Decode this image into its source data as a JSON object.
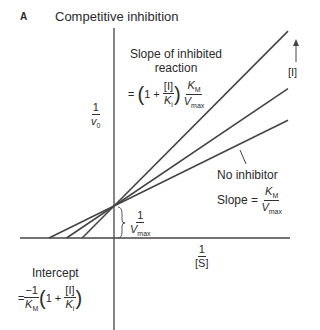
{
  "panel_letter": "A",
  "title": "Competitive inhibition",
  "y_axis_label": {
    "num": "1",
    "den": "v",
    "den_sub": "0"
  },
  "x_axis_label": {
    "num": "1",
    "den": "[S]"
  },
  "inhibitor_arrow_label": "[I]",
  "slope_inhibited": {
    "line1": "Slope of inhibited",
    "line2": "reaction",
    "eq_prefix": "=",
    "one_plus": "1 +",
    "frac_num": "[I]",
    "frac_den": "K",
    "frac_den_sub": "i",
    "km": "K",
    "km_sub": "M",
    "vmax": "V",
    "vmax_sub": "max"
  },
  "no_inhibitor": {
    "label": "No inhibitor",
    "slope_text": "Slope =",
    "km": "K",
    "km_sub": "M",
    "vmax": "V",
    "vmax_sub": "max"
  },
  "y_intercept": {
    "num": "1",
    "den": "V",
    "den_sub": "max"
  },
  "x_intercept": {
    "label": "Intercept",
    "eq_prefix": "=",
    "num": "−1",
    "den": "K",
    "den_sub": "M",
    "one_plus": "1 +",
    "frac_num": "[I]",
    "frac_den": "K",
    "frac_den_sub": "i"
  },
  "chart_data": {
    "type": "line",
    "title": "Competitive inhibition",
    "xlabel": "1/[S]",
    "ylabel": "1/v0",
    "y_intercept_shared": "1/Vmax",
    "series": [
      {
        "name": "No inhibitor",
        "x_intercept_rel": -1.0,
        "slope_rel": 1.0
      },
      {
        "name": "Inhibitor low [I]",
        "x_intercept_rel": -0.73,
        "slope_rel": 1.37
      },
      {
        "name": "Inhibitor high [I]",
        "x_intercept_rel": -0.49,
        "slope_rel": 2.04
      }
    ],
    "annotation": "Increasing [I] rotates line upward about the y-intercept"
  },
  "colors": {
    "line": "#444444",
    "text": "#2a2a2a"
  }
}
